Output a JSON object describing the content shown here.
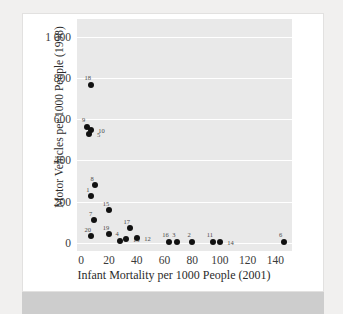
{
  "figure": {
    "background_color": "#ffffff",
    "page_background_color": "#f1f0ef",
    "panel_color": "#e9e9e9",
    "gridline_color": "#ffffff",
    "point_color": "#111111",
    "band_color": "#cdcdcd",
    "cropped_caption_text": ""
  },
  "chart_data": {
    "type": "scatter",
    "title": "",
    "xlabel": "Infant Mortality per 1000 People (2001)",
    "ylabel": "Motor Vehicles per 1000 People (1998)",
    "xlim": [
      -3,
      152
    ],
    "ylim": [
      -40,
      1085
    ],
    "xticks": [
      0,
      20,
      40,
      60,
      80,
      100,
      120,
      140
    ],
    "xtick_labels": [
      "0",
      "20",
      "40",
      "60",
      "80",
      "100",
      "120",
      "140"
    ],
    "yticks": [
      0,
      200,
      400,
      600,
      800,
      1000
    ],
    "ytick_labels": [
      "0",
      "200",
      "400",
      "600",
      "800",
      "1 000"
    ],
    "grid": "horizontal-only",
    "legend": "none",
    "point_label_position": "above-or-beside",
    "points": [
      {
        "label": "9",
        "x": 4,
        "y": 562
      },
      {
        "label": "10",
        "x": 7,
        "y": 545
      },
      {
        "label": "5",
        "x": 6,
        "y": 525
      },
      {
        "label": "18",
        "x": 7,
        "y": 765
      },
      {
        "label": "1",
        "x": 7,
        "y": 225
      },
      {
        "label": "8",
        "x": 10,
        "y": 278
      },
      {
        "label": "7",
        "x": 9,
        "y": 110
      },
      {
        "label": "20",
        "x": 7,
        "y": 32
      },
      {
        "label": "15",
        "x": 20,
        "y": 157
      },
      {
        "label": "19",
        "x": 20,
        "y": 42
      },
      {
        "label": "4",
        "x": 28,
        "y": 10
      },
      {
        "label": "13",
        "x": 32,
        "y": 20
      },
      {
        "label": "17",
        "x": 35,
        "y": 70
      },
      {
        "label": "12",
        "x": 40,
        "y": 23
      },
      {
        "label": "16",
        "x": 63,
        "y": 5
      },
      {
        "label": "3",
        "x": 69,
        "y": 5
      },
      {
        "label": "2",
        "x": 80,
        "y": 5
      },
      {
        "label": "11",
        "x": 95,
        "y": 5
      },
      {
        "label": "14",
        "x": 100,
        "y": 3
      },
      {
        "label": "6",
        "x": 146,
        "y": 5
      }
    ]
  }
}
